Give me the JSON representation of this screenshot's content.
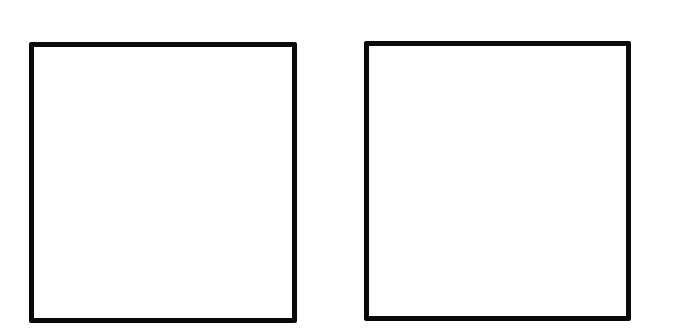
{
  "diagram": {
    "boxes": [
      {
        "id": "left",
        "label": "",
        "border_color": "#0a0a0a",
        "fill": "#ffffff"
      },
      {
        "id": "right",
        "label": "",
        "border_color": "#0a0a0a",
        "fill": "#ffffff"
      }
    ]
  }
}
